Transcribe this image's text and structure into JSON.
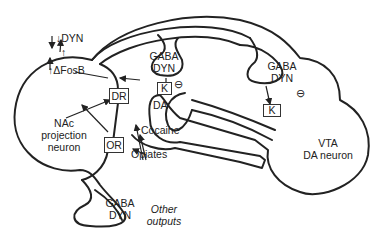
{
  "diagram": {
    "nac_neuron": {
      "label_line1": "NAc",
      "label_line2": "projection",
      "label_line3": "neuron",
      "dyn_label": "DYN",
      "dyn_direction": "down",
      "fosb_label": "ΔFosB",
      "fosb_direction": "up"
    },
    "receptors": {
      "dr": "DR",
      "or": "OR",
      "k_nac_terminal": "K",
      "k_vta": "K"
    },
    "terminals": {
      "da_terminal": "DA"
    },
    "gaba_top_middle": {
      "line1": "GABA",
      "line2": "DYN"
    },
    "gaba_top_right": {
      "line1": "GABA",
      "line2": "DYN"
    },
    "gaba_bottom": {
      "line1": "GABA",
      "line2": "DYN"
    },
    "inhibition_symbol": "⊖",
    "drugs": {
      "cocaine": "Cocaine",
      "opiates": "Opiates"
    },
    "vta_neuron": {
      "line1": "VTA",
      "line2": "DA neuron"
    },
    "other_outputs": {
      "line1": "Other",
      "line2": "outputs"
    }
  }
}
